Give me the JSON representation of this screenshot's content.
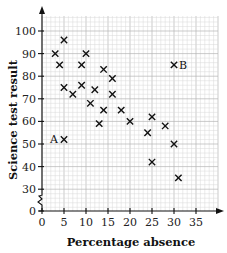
{
  "chart_data": {
    "type": "scatter",
    "title": "",
    "xlabel": "Percentage absence",
    "ylabel": "Science test result",
    "xlim": [
      0,
      40
    ],
    "ylim": [
      0,
      105
    ],
    "y_axis_break": [
      0,
      30
    ],
    "grid": true,
    "x_ticks": [
      0,
      5,
      10,
      15,
      20,
      25,
      30,
      35
    ],
    "y_ticks": [
      0,
      30,
      40,
      50,
      60,
      70,
      80,
      90,
      100
    ],
    "marker": "x",
    "points": [
      {
        "x": 3,
        "y": 90
      },
      {
        "x": 4,
        "y": 85
      },
      {
        "x": 5,
        "y": 96
      },
      {
        "x": 5,
        "y": 75
      },
      {
        "x": 7,
        "y": 72
      },
      {
        "x": 9,
        "y": 85
      },
      {
        "x": 9,
        "y": 76
      },
      {
        "x": 10,
        "y": 90
      },
      {
        "x": 11,
        "y": 68
      },
      {
        "x": 12,
        "y": 74
      },
      {
        "x": 13,
        "y": 59
      },
      {
        "x": 14,
        "y": 83
      },
      {
        "x": 14,
        "y": 65
      },
      {
        "x": 16,
        "y": 79
      },
      {
        "x": 16,
        "y": 72
      },
      {
        "x": 18,
        "y": 65
      },
      {
        "x": 20,
        "y": 60
      },
      {
        "x": 24,
        "y": 55
      },
      {
        "x": 25,
        "y": 62
      },
      {
        "x": 25,
        "y": 42
      },
      {
        "x": 28,
        "y": 58
      },
      {
        "x": 30,
        "y": 50
      },
      {
        "x": 31,
        "y": 35
      },
      {
        "x": 5,
        "y": 52,
        "label": "A"
      },
      {
        "x": 30,
        "y": 85,
        "label": "B"
      }
    ],
    "annotations": [
      {
        "text": "A",
        "x": 5,
        "y": 52,
        "position": "left"
      },
      {
        "text": "B",
        "x": 30,
        "y": 85,
        "position": "right"
      }
    ]
  }
}
